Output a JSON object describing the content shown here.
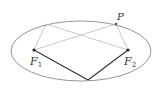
{
  "diagram": {
    "ellipse": {
      "cx": 81,
      "cy": 51,
      "rx": 70,
      "ry": 30,
      "stroke": "#888888"
    },
    "points": {
      "F1": {
        "x": 34,
        "y": 50,
        "label": "F",
        "sub": "1"
      },
      "F2": {
        "x": 128,
        "y": 50,
        "label": "F",
        "sub": "2"
      },
      "P": {
        "x": 116,
        "y": 24,
        "label": "P"
      },
      "Q": {
        "x": 46,
        "y": 24
      },
      "B": {
        "x": 88,
        "y": 80
      }
    },
    "colors": {
      "dark_line": "#333333",
      "light_line": "#bbbbbb",
      "point": "#222222"
    }
  }
}
